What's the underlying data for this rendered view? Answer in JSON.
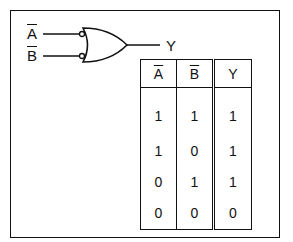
{
  "diagram": {
    "inputs": [
      {
        "label": "A",
        "overline": true
      },
      {
        "label": "B",
        "overline": true
      }
    ],
    "output": {
      "label": "Y"
    },
    "gate": "OR gate with inverted (bubbled) inputs"
  },
  "truth_table": {
    "headers": [
      "A",
      "B",
      "Y"
    ],
    "header_overline": [
      true,
      true,
      false
    ],
    "rows": [
      [
        "1",
        "1",
        "1"
      ],
      [
        "1",
        "0",
        "1"
      ],
      [
        "0",
        "1",
        "1"
      ],
      [
        "0",
        "0",
        "0"
      ]
    ]
  }
}
